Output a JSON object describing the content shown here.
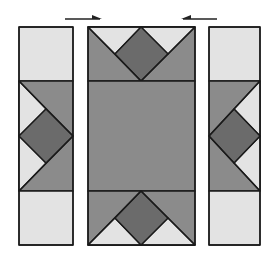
{
  "diagram": {
    "colors": {
      "background": "#ffffff",
      "light": "#e3e3e3",
      "medium": "#8b8b8b",
      "dark": "#6b6b6b",
      "outline": "#1a1a1a",
      "arrow": "#222222"
    },
    "arrows": [
      {
        "name": "left-arrow",
        "direction": "right",
        "x1": 65,
        "x2": 102,
        "y": 19
      },
      {
        "name": "right-arrow",
        "direction": "left",
        "x1": 217,
        "x2": 181,
        "y": 19
      }
    ],
    "strips": [
      {
        "name": "left-strip",
        "x": 19,
        "y": 27,
        "w": 54,
        "h": 218,
        "light_side": "left"
      },
      {
        "name": "center-block",
        "x": 88,
        "y": 27,
        "w": 107,
        "h": 218
      },
      {
        "name": "right-strip",
        "x": 209,
        "y": 27,
        "w": 51,
        "h": 218,
        "light_side": "right"
      }
    ],
    "bands": {
      "top_end": 81,
      "bottom_start": 191
    }
  }
}
